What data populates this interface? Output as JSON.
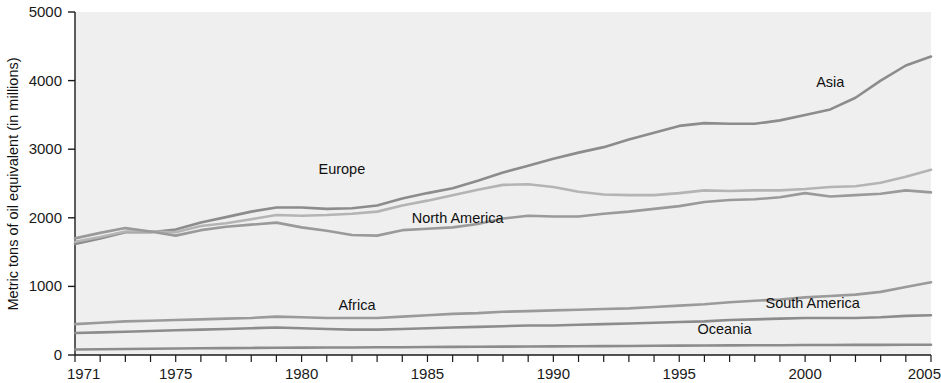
{
  "chart_data": {
    "type": "line",
    "title": "",
    "subtitle": "",
    "xlabel": "",
    "ylabel": "Metric tons of oil equivalent (in millions)",
    "xlim": [
      1971,
      2005
    ],
    "ylim": [
      0,
      5000
    ],
    "yticks": [
      0,
      1000,
      2000,
      3000,
      4000,
      5000
    ],
    "ytick_labels": [
      "0",
      "1000",
      "2000",
      "3000",
      "4000",
      "5000"
    ],
    "xticks": [
      1971,
      1975,
      1980,
      1985,
      1990,
      1995,
      2000,
      2005
    ],
    "xtick_labels": [
      "1971",
      "1975",
      "1980",
      "1985",
      "1990",
      "1995",
      "2000",
      "2005"
    ],
    "xminor_tick_interval": 1,
    "grid": false,
    "legend_position": "inline-labels",
    "plot_background": "#efefef",
    "x": [
      1971,
      1972,
      1973,
      1974,
      1975,
      1976,
      1977,
      1978,
      1979,
      1980,
      1981,
      1982,
      1983,
      1984,
      1985,
      1986,
      1987,
      1988,
      1989,
      1990,
      1991,
      1992,
      1993,
      1994,
      1995,
      1996,
      1997,
      1998,
      1999,
      2000,
      2001,
      2002,
      2003,
      2004,
      2005
    ],
    "series": [
      {
        "name": "Asia",
        "color": "#8c8c8c",
        "label_x": 2001.0,
        "label_y": 3900,
        "values": [
          1620,
          1700,
          1790,
          1790,
          1830,
          1930,
          2010,
          2090,
          2150,
          2150,
          2130,
          2140,
          2180,
          2280,
          2360,
          2430,
          2540,
          2660,
          2760,
          2860,
          2950,
          3030,
          3140,
          3240,
          3340,
          3380,
          3370,
          3370,
          3420,
          3500,
          3580,
          3750,
          4000,
          4220,
          4350
        ]
      },
      {
        "name": "Europe",
        "color": "#b4b4b4",
        "label_x": 1981.6,
        "label_y": 2640,
        "values": [
          1650,
          1720,
          1800,
          1800,
          1790,
          1880,
          1920,
          1980,
          2040,
          2030,
          2040,
          2060,
          2090,
          2180,
          2250,
          2330,
          2410,
          2480,
          2490,
          2450,
          2380,
          2340,
          2330,
          2330,
          2360,
          2400,
          2390,
          2400,
          2400,
          2420,
          2450,
          2460,
          2510,
          2600,
          2700
        ]
      },
      {
        "name": "North America",
        "color": "#9a9a9a",
        "label_x": 1986.2,
        "label_y": 1930,
        "values": [
          1700,
          1780,
          1850,
          1800,
          1740,
          1820,
          1870,
          1900,
          1930,
          1860,
          1810,
          1750,
          1740,
          1820,
          1840,
          1860,
          1910,
          1990,
          2030,
          2020,
          2020,
          2060,
          2090,
          2130,
          2170,
          2230,
          2260,
          2270,
          2300,
          2360,
          2310,
          2330,
          2350,
          2400,
          2370
        ]
      },
      {
        "name": "Africa",
        "color": "#9a9a9a",
        "label_x": 1982.2,
        "label_y": 660,
        "values": [
          450,
          470,
          490,
          500,
          510,
          520,
          530,
          540,
          560,
          550,
          540,
          540,
          540,
          560,
          580,
          600,
          610,
          630,
          640,
          650,
          660,
          670,
          680,
          700,
          720,
          740,
          770,
          790,
          810,
          840,
          860,
          880,
          920,
          990,
          1060
        ]
      },
      {
        "name": "South America",
        "color": "#8c8c8c",
        "label_x": 2000.3,
        "label_y": 690,
        "values": [
          320,
          330,
          340,
          350,
          360,
          370,
          380,
          390,
          400,
          390,
          380,
          370,
          370,
          380,
          390,
          400,
          410,
          420,
          430,
          430,
          440,
          450,
          460,
          470,
          480,
          490,
          510,
          520,
          530,
          540,
          540,
          540,
          550,
          570,
          580
        ]
      },
      {
        "name": "Oceania",
        "color": "#8c8c8c",
        "label_x": 1996.8,
        "label_y": 300,
        "values": [
          80,
          84,
          88,
          92,
          95,
          98,
          100,
          103,
          106,
          108,
          110,
          110,
          112,
          114,
          116,
          118,
          120,
          122,
          124,
          126,
          128,
          130,
          132,
          134,
          136,
          138,
          140,
          142,
          143,
          145,
          146,
          147,
          148,
          149,
          150
        ]
      }
    ]
  },
  "axis": {
    "y_title": "Metric tons of oil equivalent (in millions)"
  }
}
